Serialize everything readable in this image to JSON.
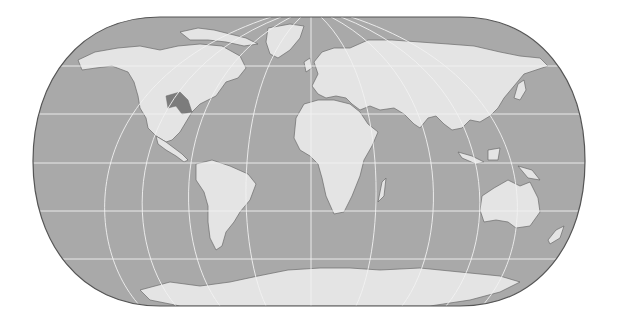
{
  "map": {
    "projection": "eckert-like pseudocylindrical (flat poles, rounded sides)",
    "colors": {
      "background": "#ffffff",
      "ocean": "#a9a9a9",
      "land": "#e4e4e4",
      "coast": "#6b6b6b",
      "graticule": "#f2f2f2",
      "border": "#555555",
      "highlight_region": "#7c7c7c"
    },
    "frame": {
      "left": 33,
      "right": 585,
      "top": 17,
      "bottom": 306,
      "central_meridian_x": 311
    },
    "graticule": {
      "parallels_y": [
        66,
        114,
        163,
        211,
        259
      ],
      "meridian_count": 11
    },
    "landmasses": [
      "north-america",
      "greenland",
      "south-america",
      "europe",
      "africa",
      "asia",
      "australia",
      "antarctica",
      "madagascar",
      "indonesia",
      "japan",
      "new-zealand",
      "british-isles",
      "arctic-islands"
    ],
    "highlighted_regions": [
      {
        "name": "central-united-states",
        "color": "#7c7c7c"
      }
    ],
    "labels": []
  }
}
